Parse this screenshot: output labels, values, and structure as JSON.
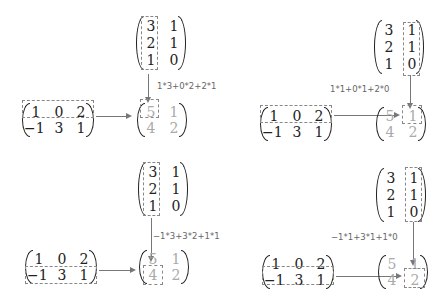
{
  "matrices": {
    "B": [
      [
        "3",
        "1"
      ],
      [
        "2",
        "1"
      ],
      [
        "1",
        "0"
      ]
    ],
    "A": [
      [
        "1",
        "0",
        "2"
      ],
      [
        "-1",
        "3",
        "1"
      ]
    ],
    "C": [
      [
        "5",
        "1"
      ],
      [
        "4",
        "2"
      ]
    ]
  },
  "panels": [
    {
      "label": "1*3+0*2+2*1",
      "highlight_row": 0,
      "highlight_col": 0,
      "result_cell": "5"
    },
    {
      "label": "1*1+0*1+2*0",
      "highlight_row": 0,
      "highlight_col": 1,
      "result_cell": "1"
    },
    {
      "label": "-1*3+3*2+1*1",
      "highlight_row": 1,
      "highlight_col": 0,
      "result_cell": "4"
    },
    {
      "label": "-1*1+3*1+1*0",
      "highlight_row": 1,
      "highlight_col": 1,
      "result_cell": "2"
    }
  ],
  "colors": {
    "text": "#222222",
    "result_text": "#aaaaaa",
    "dashes": "#888888",
    "arrows": "#777777"
  }
}
